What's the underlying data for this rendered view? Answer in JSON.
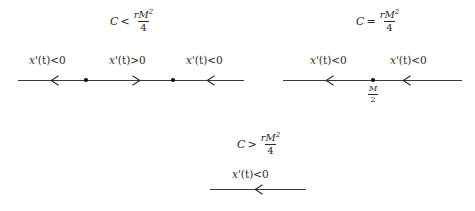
{
  "figure": {
    "type": "phase-line-diagram",
    "background_color": "#ffffff",
    "ink_color": "#2b2b2b"
  },
  "panels": [
    {
      "id": "case-less-than",
      "condition": {
        "lhs": "C",
        "relation": "<",
        "numerator_r": "r",
        "numerator_M": "M",
        "exponent": "2",
        "denominator": "4",
        "full_text": "C < rM^2/4"
      },
      "intervals": [
        {
          "label_x": "x",
          "label_prime": "'",
          "label_t": "(t)",
          "relation": "<",
          "value": "0",
          "direction": "left"
        },
        {
          "label_x": "x",
          "label_prime": "'",
          "label_t": "(t)",
          "relation": ">",
          "value": "0",
          "direction": "right"
        },
        {
          "label_x": "x",
          "label_prime": "'",
          "label_t": "(t)",
          "relation": "<",
          "value": "0",
          "direction": "left"
        }
      ],
      "equilibria": [
        "",
        ""
      ]
    },
    {
      "id": "case-equal",
      "condition": {
        "lhs": "C",
        "relation": "=",
        "numerator_r": "r",
        "numerator_M": "M",
        "exponent": "2",
        "denominator": "4",
        "full_text": "C = rM^2/4"
      },
      "intervals": [
        {
          "label_x": "x",
          "label_prime": "'",
          "label_t": "(t)",
          "relation": "<",
          "value": "0",
          "direction": "left"
        },
        {
          "label_x": "x",
          "label_prime": "'",
          "label_t": "(t)",
          "relation": "<",
          "value": "0",
          "direction": "left"
        }
      ],
      "equilibria": [
        "M/2"
      ],
      "equilibrium_label": {
        "numerator": "M",
        "denominator": "2"
      }
    },
    {
      "id": "case-greater-than",
      "condition": {
        "lhs": "C",
        "relation": ">",
        "numerator_r": "r",
        "numerator_M": "M",
        "exponent": "2",
        "denominator": "4",
        "full_text": "C > rM^2/4"
      },
      "intervals": [
        {
          "label_x": "x",
          "label_prime": "'",
          "label_t": "(t)",
          "relation": "<",
          "value": "0",
          "direction": "left"
        }
      ],
      "equilibria": []
    }
  ]
}
